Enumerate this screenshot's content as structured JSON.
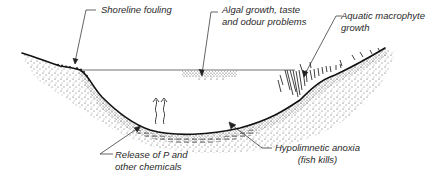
{
  "diagram": {
    "labels": {
      "shoreline": {
        "lines": [
          "Shoreline fouling"
        ]
      },
      "algal": {
        "lines": [
          "Algal growth, taste",
          "and odour problems"
        ]
      },
      "macrophyte": {
        "lines": [
          "Aquatic macrophyte",
          "growth"
        ]
      },
      "release": {
        "lines": [
          "Release of P and",
          "other chemicals"
        ]
      },
      "anoxia": {
        "lines": [
          "Hypolimnetic anoxia",
          "(fish kills)"
        ]
      }
    },
    "colors": {
      "ink": "#1a1a1a",
      "stipple": "#3a3a3a",
      "background": "#ffffff"
    }
  }
}
